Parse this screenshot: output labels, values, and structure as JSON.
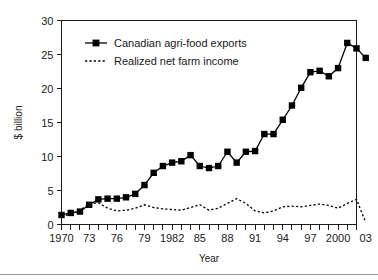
{
  "chart_data": {
    "type": "line",
    "title": "",
    "xlabel": "Year",
    "ylabel": "$ billion",
    "xlim": [
      1970,
      2003
    ],
    "ylim": [
      0,
      30
    ],
    "yticks": [
      0,
      5,
      10,
      15,
      20,
      25,
      30
    ],
    "ytick_labels": [
      "0",
      "5",
      "10",
      "15",
      "20",
      "25",
      "30"
    ],
    "x": [
      1970,
      1971,
      1972,
      1973,
      1974,
      1975,
      1976,
      1977,
      1978,
      1979,
      1980,
      1981,
      1982,
      1983,
      1984,
      1985,
      1986,
      1987,
      1988,
      1989,
      1990,
      1991,
      1992,
      1993,
      1994,
      1995,
      1996,
      1997,
      1998,
      1999,
      2000,
      2001,
      2002,
      2003
    ],
    "xtick_labels": [
      "1970",
      "",
      "",
      "73",
      "",
      "",
      "76",
      "",
      "",
      "79",
      "",
      "",
      "1982",
      "",
      "",
      "85",
      "",
      "",
      "88",
      "",
      "",
      "91",
      "",
      "",
      "94",
      "",
      "",
      "97",
      "",
      "",
      "2000",
      "",
      "",
      "03"
    ],
    "xtick_label_years": [
      1970,
      1973,
      1976,
      1979,
      1982,
      1985,
      1988,
      1991,
      1994,
      1997,
      2000,
      2003
    ],
    "grid": false,
    "legend_position": "upper-left-inside",
    "series": [
      {
        "name": "Canadian agri-food exports",
        "style": "solid-with-square-markers",
        "marker": "square",
        "color": "#000000",
        "values": [
          1.4,
          1.7,
          1.9,
          2.9,
          3.7,
          3.8,
          3.8,
          4.0,
          4.5,
          5.8,
          7.6,
          8.6,
          9.1,
          9.3,
          10.2,
          8.6,
          8.3,
          8.6,
          10.7,
          9.1,
          10.7,
          10.8,
          13.3,
          13.3,
          15.4,
          17.5,
          20.1,
          22.4,
          22.6,
          21.8,
          23.0,
          26.7,
          25.9,
          24.5
        ]
      },
      {
        "name": "Realized net farm income",
        "style": "dotted",
        "marker": "none",
        "color": "#000000",
        "values": [
          1.2,
          1.5,
          2.1,
          3.0,
          3.2,
          2.4,
          2.0,
          2.1,
          2.4,
          2.9,
          2.5,
          2.3,
          2.2,
          2.1,
          2.5,
          2.9,
          2.1,
          2.4,
          3.1,
          3.8,
          3.1,
          2.0,
          1.7,
          2.0,
          2.6,
          2.7,
          2.6,
          2.8,
          3.0,
          2.8,
          2.4,
          3.1,
          3.7,
          0.3
        ]
      }
    ],
    "legend": [
      {
        "label": "Canadian agri-food exports",
        "style": "solid-square"
      },
      {
        "label": "Realized net farm income",
        "style": "dotted"
      }
    ]
  }
}
